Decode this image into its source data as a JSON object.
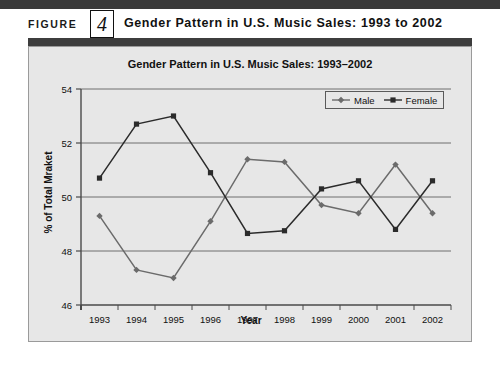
{
  "figure": {
    "label": "FIGURE",
    "number": "4",
    "title": "Gender Pattern in U.S. Music Sales: 1993 to 2002"
  },
  "chart_data": {
    "type": "line",
    "title": "Gender Pattern in U.S. Music Sales: 1993–2002",
    "xlabel": "Year",
    "ylabel": "% of Total Mraket",
    "categories": [
      "1993",
      "1994",
      "1995",
      "1996",
      "1997",
      "1998",
      "1999",
      "2000",
      "2001",
      "2002"
    ],
    "series": [
      {
        "name": "Male",
        "marker": "diamond",
        "color": "#6b6b6b",
        "values": [
          49.3,
          47.3,
          47.0,
          49.1,
          51.4,
          51.3,
          49.7,
          49.4,
          51.2,
          49.4
        ]
      },
      {
        "name": "Female",
        "marker": "square",
        "color": "#2b2b2b",
        "values": [
          50.7,
          52.7,
          53.0,
          50.9,
          48.65,
          48.75,
          50.3,
          50.6,
          48.8,
          50.6
        ]
      }
    ],
    "ylim": [
      46,
      54
    ],
    "yticks": [
      46,
      48,
      50,
      52,
      54
    ],
    "ytick_labels": [
      "46",
      "48",
      "50",
      "52",
      "54"
    ],
    "grid": "horizontal",
    "legend_position": "top-right",
    "legend_entries": [
      "Male",
      "Female"
    ]
  },
  "colors": {
    "panel_background": "#e7e7e7",
    "header_bar": "#3d3d3d",
    "axis": "#4a4a4a",
    "gridline": "#6f6f6f"
  }
}
